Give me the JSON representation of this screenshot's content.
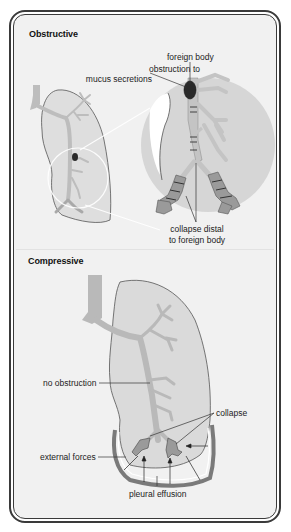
{
  "figure": {
    "sections": [
      {
        "id": "obstructive",
        "title": "Obstructive",
        "labels": {
          "foreign_body": "foreign body",
          "obstruction_line1": "obstruction to",
          "obstruction_line2": "mucus secretions",
          "collapse_line1": "collapse distal",
          "collapse_line2": "to foreign body"
        }
      },
      {
        "id": "compressive",
        "title": "Compressive",
        "labels": {
          "no_obstruction": "no obstruction",
          "collapse": "collapse",
          "external_forces": "external forces",
          "pleural_effusion": "pleural effusion"
        }
      }
    ],
    "colors": {
      "background": "#f1f1f1",
      "frame": "#3a3a3a",
      "lung_fill": "#dcdcdc",
      "airway_fill": "#b9b9b9",
      "foreign_body": "#2a2a2a",
      "magnifier_fill": "#d6d6d6"
    }
  }
}
